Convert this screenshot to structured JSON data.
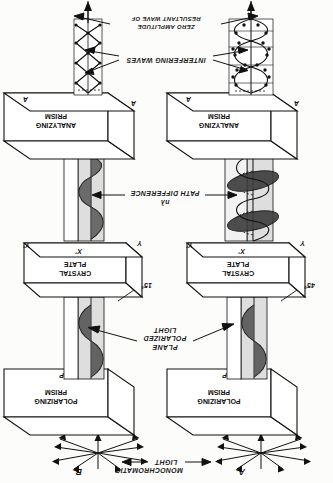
{
  "figure": {
    "title_note": "Optical arrangement: polarizing prism, crystal plate, analyzing prism",
    "orientation_deg": 180,
    "source_labels": {
      "monochromatic_light": "MONOCHROMATIC LIGHT",
      "plane_polarized_light": "PLANE POLARIZED LIGHT",
      "path_difference": "PATH DIFFERENCE",
      "path_difference_value": "nλ",
      "interfering_waves": "INTERFERING WAVES",
      "resultant_wave_line1": "RESULTANT WAVE OF",
      "resultant_wave_line2": "ZERO AMPLITUDE"
    },
    "components": {
      "polarizing_prism_line1": "POLARIZING",
      "polarizing_prism_line2": "PRISM",
      "crystal_plate_line1": "CRYSTAL",
      "crystal_plate_line2": "PLATE",
      "analyzing_prism_line1": "ANALYZING",
      "analyzing_prism_line2": "PRISM"
    },
    "axis_markers": {
      "p_left": "P",
      "p_right": "P",
      "x_prime": "X'",
      "y": "Y",
      "y_prime": "Y'",
      "a_left": "A",
      "a_right": "A"
    },
    "columns": [
      {
        "id": "A",
        "panel_label": "A",
        "crystal_angle": "45°",
        "description": "crystal plate at 45 degrees, elliptical interfering waves"
      },
      {
        "id": "B",
        "panel_label": "B",
        "crystal_angle": "15°",
        "description": "crystal plate at 15 degrees, planar interfering waves"
      }
    ],
    "colors": {
      "ink": "#111111",
      "paper": "#fcfcfa",
      "beam_fill": "#d8d8d4",
      "wave_fill": "#5a5a58"
    }
  }
}
